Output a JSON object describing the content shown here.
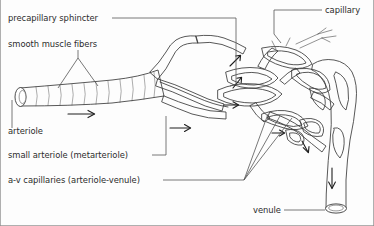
{
  "figure": {
    "background_color": "#fdfdfd",
    "ink_color": "#3a3a3a",
    "stipple_color": "#6e6e6e"
  },
  "labels": {
    "precapillary_sphincter": "precapillary sphincter",
    "smooth_muscle_fibers": "smooth muscle fibers",
    "arteriole": "arteriole",
    "small_arteriole": "small arteriole (metarteriole)",
    "av_capillaries": "a-v capillaries (arteriole-venule)",
    "capillary": "capillary",
    "venule": "venule"
  },
  "flow_arrows": [
    {
      "name": "arrow-arteriole",
      "direction": "right"
    },
    {
      "name": "arrow-metarteriole",
      "direction": "right"
    },
    {
      "name": "arrow-capillary-entry",
      "direction": "up-right"
    },
    {
      "name": "arrow-sphincter",
      "direction": "up-right"
    },
    {
      "name": "arrow-bed-right",
      "direction": "right"
    },
    {
      "name": "arrow-venule-branch",
      "direction": "down-right"
    },
    {
      "name": "arrow-venule-outflow",
      "direction": "down"
    }
  ]
}
